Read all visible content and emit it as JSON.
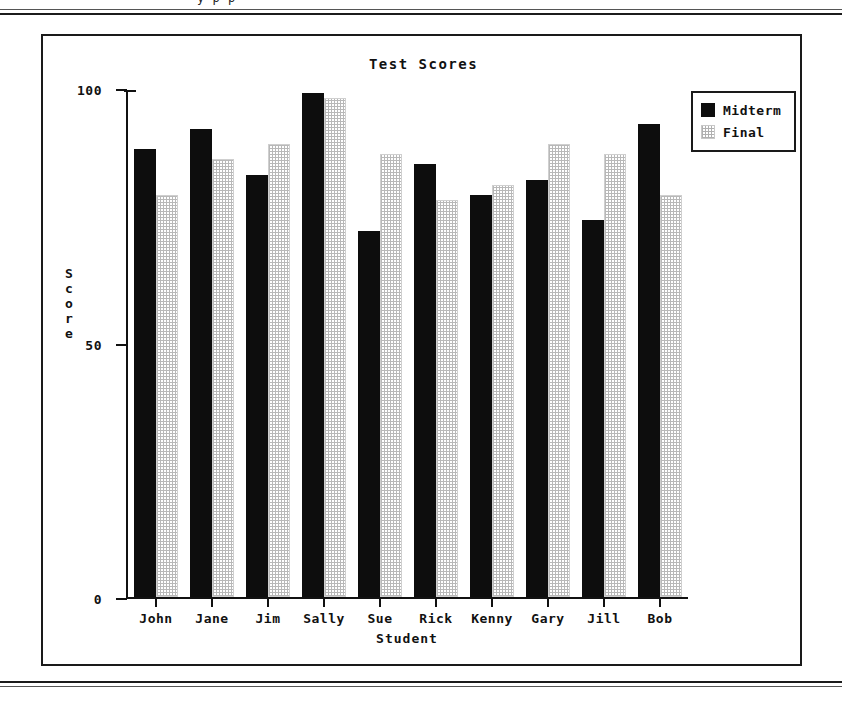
{
  "page": {
    "scan_header_fragment": "y  p   p"
  },
  "chart_data": {
    "type": "bar",
    "title": "Test Scores",
    "xlabel": "Student",
    "ylabel": "Score",
    "categories": [
      "John",
      "Jane",
      "Jim",
      "Sally",
      "Sue",
      "Rick",
      "Kenny",
      "Gary",
      "Jill",
      "Bob"
    ],
    "series": [
      {
        "name": "Midterm",
        "color": "#0d0d0d",
        "values": [
          88,
          92,
          83,
          99,
          72,
          85,
          79,
          82,
          74,
          93
        ]
      },
      {
        "name": "Final",
        "color": "#d8d8d8",
        "values": [
          79,
          86,
          89,
          98,
          87,
          78,
          81,
          89,
          87,
          79
        ]
      }
    ],
    "ylim": [
      0,
      100
    ],
    "yticks": [
      0,
      50,
      100
    ],
    "ytick_labels": [
      "0",
      "50",
      "100"
    ],
    "grid": false,
    "legend_position": "upper right"
  }
}
